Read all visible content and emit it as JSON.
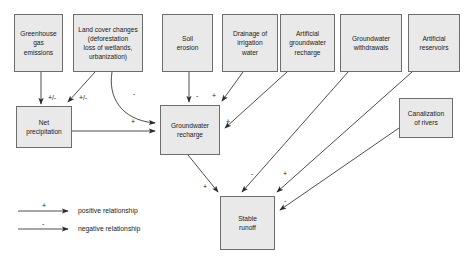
{
  "diagram": {
    "colors": {
      "box_fill": "#e9e9e9",
      "box_border": "#6d6d6d",
      "arrow": "#333333",
      "text": "#1a1a1a",
      "background": "#ffffff"
    },
    "nodes": [
      {
        "id": "greenhouse",
        "label": "Greenhouse\ngas\nemissions",
        "x": 14,
        "y": 14,
        "w": 49,
        "h": 58
      },
      {
        "id": "landcover",
        "label": "Land cover changes\n(deforestation\nloss of wetlands,\nurbanization)",
        "x": 73,
        "y": 14,
        "w": 70,
        "h": 58
      },
      {
        "id": "soilerosion",
        "label": "Soil\nerosion",
        "x": 162,
        "y": 14,
        "w": 51,
        "h": 58
      },
      {
        "id": "drainage",
        "label": "Drainage of\nirrigation\nwater",
        "x": 222,
        "y": 14,
        "w": 56,
        "h": 58
      },
      {
        "id": "artrecharge",
        "label": "Artificial\ngroundwater\nrecharge",
        "x": 280,
        "y": 14,
        "w": 55,
        "h": 58
      },
      {
        "id": "gwwithdrawals",
        "label": "Groundwater\nwithdrawals",
        "x": 340,
        "y": 14,
        "w": 62,
        "h": 58
      },
      {
        "id": "artreservoirs",
        "label": "Artificial\nreservoirs",
        "x": 408,
        "y": 14,
        "w": 52,
        "h": 58
      },
      {
        "id": "canalization",
        "label": "Canalization\nof rivers",
        "x": 399,
        "y": 98,
        "w": 54,
        "h": 40
      },
      {
        "id": "netprecip",
        "label": "Net\nprecipitation",
        "x": 16,
        "y": 106,
        "w": 56,
        "h": 42
      },
      {
        "id": "gwrecharge",
        "label": "Groundwater\nrecharge",
        "x": 160,
        "y": 105,
        "w": 60,
        "h": 50
      },
      {
        "id": "stablerunoff",
        "label": "Stable\nrunoff",
        "x": 220,
        "y": 196,
        "w": 55,
        "h": 54
      }
    ],
    "edges": [
      {
        "from": "greenhouse",
        "to": "netprecip",
        "sign": "+/-",
        "label_x": 48,
        "label_y": 94
      },
      {
        "from": "landcover",
        "to": "netprecip",
        "sign": "+/-",
        "label_x": 79,
        "label_y": 94
      },
      {
        "from": "landcover",
        "to": "gwrecharge",
        "sign": "-",
        "label_x": 133,
        "label_y": 90
      },
      {
        "from": "netprecip",
        "to": "gwrecharge",
        "sign": "+",
        "label_x": 131,
        "label_y": 118
      },
      {
        "from": "soilerosion",
        "to": "gwrecharge",
        "sign": "-",
        "label_x": 196,
        "label_y": 92
      },
      {
        "from": "drainage",
        "to": "gwrecharge",
        "sign": "+",
        "label_x": 212,
        "label_y": 92
      },
      {
        "from": "artrecharge",
        "to": "gwrecharge",
        "sign": "+",
        "label_x": 226,
        "label_y": 118
      },
      {
        "from": "gwrecharge",
        "to": "stablerunoff",
        "sign": "+",
        "label_x": 203,
        "label_y": 183
      },
      {
        "from": "gwwithdrawals",
        "to": "stablerunoff",
        "sign": "-",
        "label_x": 251,
        "label_y": 170
      },
      {
        "from": "artreservoirs",
        "to": "stablerunoff",
        "sign": "+",
        "label_x": 283,
        "label_y": 170
      },
      {
        "from": "canalization",
        "to": "stablerunoff",
        "sign": "-",
        "label_x": 284,
        "label_y": 197
      }
    ],
    "legend": {
      "items": [
        {
          "sign": "+",
          "text": "positive relationship"
        },
        {
          "sign": "-",
          "text": "negative relationship"
        }
      ]
    }
  }
}
